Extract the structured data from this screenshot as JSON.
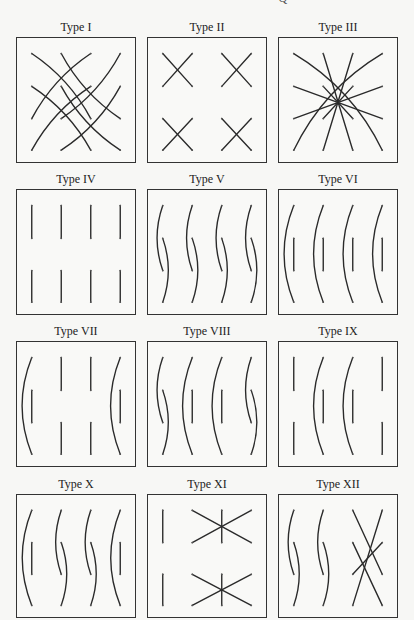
{
  "header": {
    "cut_text": "· · · · · · · · · · · · · · · · · Q"
  },
  "grid": {
    "cols": 4,
    "rows": 4
  },
  "panels": [
    {
      "title": "Type I",
      "strokes": [
        {
          "kind": "arc",
          "from": [
            0,
            0
          ],
          "to": [
            2,
            2
          ],
          "bow": 0.25
        },
        {
          "kind": "arc",
          "from": [
            0,
            1
          ],
          "to": [
            2,
            3
          ],
          "bow": 0.25
        },
        {
          "kind": "arc",
          "from": [
            1,
            0
          ],
          "to": [
            3,
            2
          ],
          "bow": -0.25
        },
        {
          "kind": "arc",
          "from": [
            1,
            1
          ],
          "to": [
            3,
            3
          ],
          "bow": -0.25
        },
        {
          "kind": "arc",
          "from": [
            2,
            0
          ],
          "to": [
            0,
            2
          ],
          "bow": -0.25
        },
        {
          "kind": "arc",
          "from": [
            2,
            1
          ],
          "to": [
            0,
            3
          ],
          "bow": -0.25
        },
        {
          "kind": "arc",
          "from": [
            3,
            0
          ],
          "to": [
            1,
            2
          ],
          "bow": 0.25
        },
        {
          "kind": "arc",
          "from": [
            3,
            1
          ],
          "to": [
            1,
            3
          ],
          "bow": 0.25
        }
      ]
    },
    {
      "title": "Type II",
      "strokes": [
        {
          "kind": "line",
          "from": [
            0,
            0
          ],
          "to": [
            1,
            1
          ]
        },
        {
          "kind": "line",
          "from": [
            1,
            0
          ],
          "to": [
            0,
            1
          ]
        },
        {
          "kind": "line",
          "from": [
            2,
            0
          ],
          "to": [
            3,
            1
          ]
        },
        {
          "kind": "line",
          "from": [
            3,
            0
          ],
          "to": [
            2,
            1
          ]
        },
        {
          "kind": "line",
          "from": [
            0,
            2
          ],
          "to": [
            1,
            3
          ]
        },
        {
          "kind": "line",
          "from": [
            1,
            2
          ],
          "to": [
            0,
            3
          ]
        },
        {
          "kind": "line",
          "from": [
            2,
            2
          ],
          "to": [
            3,
            3
          ]
        },
        {
          "kind": "line",
          "from": [
            3,
            2
          ],
          "to": [
            2,
            3
          ]
        }
      ]
    },
    {
      "title": "Type III",
      "strokes": [
        {
          "kind": "arc",
          "from": [
            0,
            0
          ],
          "to": [
            3,
            3
          ],
          "bow": 0.3
        },
        {
          "kind": "arc",
          "from": [
            3,
            0
          ],
          "to": [
            0,
            3
          ],
          "bow": -0.3
        },
        {
          "kind": "line",
          "from": [
            1,
            0
          ],
          "to": [
            2,
            3
          ]
        },
        {
          "kind": "line",
          "from": [
            2,
            0
          ],
          "to": [
            1,
            3
          ]
        },
        {
          "kind": "line",
          "from": [
            0,
            1
          ],
          "to": [
            3,
            2
          ]
        },
        {
          "kind": "line",
          "from": [
            3,
            1
          ],
          "to": [
            0,
            2
          ]
        },
        {
          "kind": "line",
          "from": [
            1,
            1
          ],
          "to": [
            2,
            2
          ]
        },
        {
          "kind": "line",
          "from": [
            2,
            1
          ],
          "to": [
            1,
            2
          ]
        }
      ]
    },
    {
      "title": "Type IV",
      "strokes": [
        {
          "kind": "line",
          "from": [
            0,
            0
          ],
          "to": [
            0,
            1
          ]
        },
        {
          "kind": "line",
          "from": [
            1,
            0
          ],
          "to": [
            1,
            1
          ]
        },
        {
          "kind": "line",
          "from": [
            2,
            0
          ],
          "to": [
            2,
            1
          ]
        },
        {
          "kind": "line",
          "from": [
            3,
            0
          ],
          "to": [
            3,
            1
          ]
        },
        {
          "kind": "line",
          "from": [
            0,
            2
          ],
          "to": [
            0,
            3
          ]
        },
        {
          "kind": "line",
          "from": [
            1,
            2
          ],
          "to": [
            1,
            3
          ]
        },
        {
          "kind": "line",
          "from": [
            2,
            2
          ],
          "to": [
            2,
            3
          ]
        },
        {
          "kind": "line",
          "from": [
            3,
            2
          ],
          "to": [
            3,
            3
          ]
        }
      ]
    },
    {
      "title": "Type V",
      "strokes": [
        {
          "kind": "arc",
          "from": [
            0,
            0
          ],
          "to": [
            0,
            2
          ],
          "bow": -0.35
        },
        {
          "kind": "arc",
          "from": [
            0,
            1
          ],
          "to": [
            0,
            3
          ],
          "bow": 0.35
        },
        {
          "kind": "arc",
          "from": [
            1,
            0
          ],
          "to": [
            1,
            2
          ],
          "bow": -0.35
        },
        {
          "kind": "arc",
          "from": [
            1,
            1
          ],
          "to": [
            1,
            3
          ],
          "bow": 0.35
        },
        {
          "kind": "arc",
          "from": [
            2,
            0
          ],
          "to": [
            2,
            2
          ],
          "bow": -0.35
        },
        {
          "kind": "arc",
          "from": [
            2,
            1
          ],
          "to": [
            2,
            3
          ],
          "bow": 0.35
        },
        {
          "kind": "arc",
          "from": [
            3,
            0
          ],
          "to": [
            3,
            2
          ],
          "bow": -0.35
        },
        {
          "kind": "arc",
          "from": [
            3,
            1
          ],
          "to": [
            3,
            3
          ],
          "bow": 0.35
        }
      ]
    },
    {
      "title": "Type VI",
      "strokes": [
        {
          "kind": "arc",
          "from": [
            0,
            0
          ],
          "to": [
            0,
            3
          ],
          "bow": -0.4
        },
        {
          "kind": "line",
          "from": [
            0,
            1
          ],
          "to": [
            0,
            2
          ]
        },
        {
          "kind": "arc",
          "from": [
            1,
            0
          ],
          "to": [
            1,
            3
          ],
          "bow": -0.4
        },
        {
          "kind": "line",
          "from": [
            1,
            1
          ],
          "to": [
            1,
            2
          ]
        },
        {
          "kind": "arc",
          "from": [
            2,
            0
          ],
          "to": [
            2,
            3
          ],
          "bow": -0.4
        },
        {
          "kind": "line",
          "from": [
            2,
            1
          ],
          "to": [
            2,
            2
          ]
        },
        {
          "kind": "arc",
          "from": [
            3,
            0
          ],
          "to": [
            3,
            3
          ],
          "bow": -0.4
        },
        {
          "kind": "line",
          "from": [
            3,
            1
          ],
          "to": [
            3,
            2
          ]
        }
      ]
    },
    {
      "title": "Type VII",
      "strokes": [
        {
          "kind": "arc",
          "from": [
            0,
            0
          ],
          "to": [
            0,
            3
          ],
          "bow": -0.4
        },
        {
          "kind": "line",
          "from": [
            0,
            1
          ],
          "to": [
            0,
            2
          ]
        },
        {
          "kind": "line",
          "from": [
            1,
            0
          ],
          "to": [
            1,
            1
          ]
        },
        {
          "kind": "line",
          "from": [
            1,
            2
          ],
          "to": [
            1,
            3
          ]
        },
        {
          "kind": "line",
          "from": [
            2,
            0
          ],
          "to": [
            2,
            1
          ]
        },
        {
          "kind": "line",
          "from": [
            2,
            2
          ],
          "to": [
            2,
            3
          ]
        },
        {
          "kind": "arc",
          "from": [
            3,
            0
          ],
          "to": [
            3,
            3
          ],
          "bow": -0.4
        },
        {
          "kind": "line",
          "from": [
            3,
            1
          ],
          "to": [
            3,
            2
          ]
        }
      ]
    },
    {
      "title": "Type VIII",
      "strokes": [
        {
          "kind": "arc",
          "from": [
            0,
            0
          ],
          "to": [
            0,
            2
          ],
          "bow": -0.35
        },
        {
          "kind": "arc",
          "from": [
            0,
            1
          ],
          "to": [
            0,
            3
          ],
          "bow": 0.35
        },
        {
          "kind": "arc",
          "from": [
            1,
            0
          ],
          "to": [
            1,
            3
          ],
          "bow": -0.4
        },
        {
          "kind": "line",
          "from": [
            1,
            1
          ],
          "to": [
            1,
            2
          ]
        },
        {
          "kind": "arc",
          "from": [
            2,
            0
          ],
          "to": [
            2,
            3
          ],
          "bow": -0.4
        },
        {
          "kind": "line",
          "from": [
            2,
            1
          ],
          "to": [
            2,
            2
          ]
        },
        {
          "kind": "arc",
          "from": [
            3,
            0
          ],
          "to": [
            3,
            2
          ],
          "bow": -0.35
        },
        {
          "kind": "arc",
          "from": [
            3,
            1
          ],
          "to": [
            3,
            3
          ],
          "bow": 0.35
        }
      ]
    },
    {
      "title": "Type IX",
      "strokes": [
        {
          "kind": "line",
          "from": [
            0,
            0
          ],
          "to": [
            0,
            1
          ]
        },
        {
          "kind": "line",
          "from": [
            0,
            2
          ],
          "to": [
            0,
            3
          ]
        },
        {
          "kind": "arc",
          "from": [
            1,
            0
          ],
          "to": [
            1,
            3
          ],
          "bow": -0.4
        },
        {
          "kind": "line",
          "from": [
            1,
            1
          ],
          "to": [
            1,
            2
          ]
        },
        {
          "kind": "arc",
          "from": [
            2,
            0
          ],
          "to": [
            2,
            3
          ],
          "bow": -0.4
        },
        {
          "kind": "line",
          "from": [
            2,
            1
          ],
          "to": [
            2,
            2
          ]
        },
        {
          "kind": "line",
          "from": [
            3,
            0
          ],
          "to": [
            3,
            1
          ]
        },
        {
          "kind": "line",
          "from": [
            3,
            2
          ],
          "to": [
            3,
            3
          ]
        }
      ]
    },
    {
      "title": "Type X",
      "strokes": [
        {
          "kind": "arc",
          "from": [
            0,
            0
          ],
          "to": [
            0,
            3
          ],
          "bow": -0.4
        },
        {
          "kind": "line",
          "from": [
            0,
            1
          ],
          "to": [
            0,
            2
          ]
        },
        {
          "kind": "arc",
          "from": [
            1,
            0
          ],
          "to": [
            1,
            2
          ],
          "bow": -0.35
        },
        {
          "kind": "arc",
          "from": [
            1,
            1
          ],
          "to": [
            1,
            3
          ],
          "bow": 0.35
        },
        {
          "kind": "arc",
          "from": [
            2,
            0
          ],
          "to": [
            2,
            2
          ],
          "bow": -0.35
        },
        {
          "kind": "arc",
          "from": [
            2,
            1
          ],
          "to": [
            2,
            3
          ],
          "bow": 0.35
        },
        {
          "kind": "arc",
          "from": [
            3,
            0
          ],
          "to": [
            3,
            3
          ],
          "bow": -0.4
        },
        {
          "kind": "line",
          "from": [
            3,
            1
          ],
          "to": [
            3,
            2
          ]
        }
      ]
    },
    {
      "title": "Type XI",
      "strokes": [
        {
          "kind": "line",
          "from": [
            0,
            0
          ],
          "to": [
            0,
            1
          ]
        },
        {
          "kind": "line",
          "from": [
            0,
            2
          ],
          "to": [
            0,
            3
          ]
        },
        {
          "kind": "line",
          "from": [
            1,
            0
          ],
          "to": [
            3,
            1
          ]
        },
        {
          "kind": "line",
          "from": [
            3,
            0
          ],
          "to": [
            1,
            1
          ]
        },
        {
          "kind": "line",
          "from": [
            2,
            0
          ],
          "to": [
            2,
            1
          ]
        },
        {
          "kind": "line",
          "from": [
            1,
            2
          ],
          "to": [
            3,
            3
          ]
        },
        {
          "kind": "line",
          "from": [
            3,
            2
          ],
          "to": [
            1,
            3
          ]
        },
        {
          "kind": "line",
          "from": [
            2,
            2
          ],
          "to": [
            2,
            3
          ]
        }
      ]
    },
    {
      "title": "Type XII",
      "strokes": [
        {
          "kind": "arc",
          "from": [
            0,
            0
          ],
          "to": [
            0,
            2
          ],
          "bow": -0.35
        },
        {
          "kind": "arc",
          "from": [
            0,
            1
          ],
          "to": [
            0,
            3
          ],
          "bow": 0.35
        },
        {
          "kind": "arc",
          "from": [
            1,
            0
          ],
          "to": [
            1,
            2
          ],
          "bow": -0.35
        },
        {
          "kind": "arc",
          "from": [
            1,
            1
          ],
          "to": [
            1,
            3
          ],
          "bow": 0.35
        },
        {
          "kind": "line",
          "from": [
            2,
            0
          ],
          "to": [
            3,
            2
          ]
        },
        {
          "kind": "line",
          "from": [
            3,
            0
          ],
          "to": [
            2,
            3
          ]
        },
        {
          "kind": "line",
          "from": [
            2,
            1
          ],
          "to": [
            3,
            3
          ]
        },
        {
          "kind": "line",
          "from": [
            3,
            1
          ],
          "to": [
            2,
            2
          ]
        }
      ]
    }
  ],
  "colors": {
    "stroke": "#2a2a2a",
    "dot": "#555555",
    "border": "#333333"
  }
}
